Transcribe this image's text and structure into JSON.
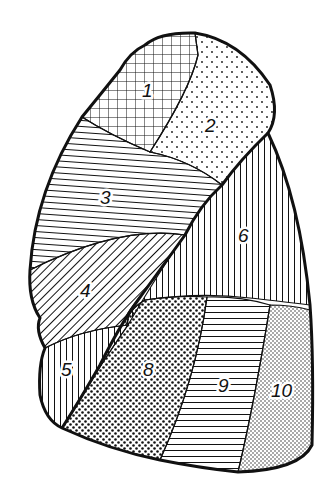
{
  "diagram": {
    "type": "lung-segment-map",
    "colors": {
      "line": "#111111",
      "background": "#ffffff"
    },
    "segments": [
      {
        "id": "1",
        "label": "1",
        "pattern": "crosshatch"
      },
      {
        "id": "2",
        "label": "2",
        "pattern": "sparse-dots"
      },
      {
        "id": "3",
        "label": "3",
        "pattern": "horizontal-lines"
      },
      {
        "id": "4",
        "label": "4",
        "pattern": "diagonal-lines"
      },
      {
        "id": "5",
        "label": "5",
        "pattern": "vertical-lines"
      },
      {
        "id": "6",
        "label": "6",
        "pattern": "vertical-lines"
      },
      {
        "id": "8",
        "label": "8",
        "pattern": "dense-dots"
      },
      {
        "id": "9",
        "label": "9",
        "pattern": "horizontal-lines"
      },
      {
        "id": "10",
        "label": "10",
        "pattern": "fine-dots"
      }
    ]
  }
}
